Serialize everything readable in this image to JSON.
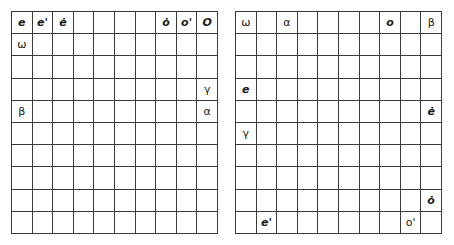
{
  "grids": [
    {
      "name": "left",
      "rows": 10,
      "cols": 10,
      "symbols": [
        {
          "row": 0,
          "col": 0,
          "text": "e",
          "italic": true
        },
        {
          "row": 0,
          "col": 1,
          "text": "e'",
          "italic": true
        },
        {
          "row": 0,
          "col": 2,
          "text": "ė",
          "italic": true
        },
        {
          "row": 0,
          "col": 7,
          "text": "ȯ",
          "italic": true
        },
        {
          "row": 0,
          "col": 8,
          "text": "o'",
          "italic": true
        },
        {
          "row": 0,
          "col": 9,
          "text": "O",
          "italic": true
        },
        {
          "row": 1,
          "col": 0,
          "text": "ω",
          "italic": false
        },
        {
          "row": 3,
          "col": 9,
          "text": "γ",
          "italic": false
        },
        {
          "row": 4,
          "col": 0,
          "text": "β",
          "italic": false
        },
        {
          "row": 4,
          "col": 9,
          "text": "α",
          "italic": false
        }
      ]
    },
    {
      "name": "right",
      "rows": 10,
      "cols": 10,
      "symbols": [
        {
          "row": 0,
          "col": 0,
          "text": "ω",
          "italic": false
        },
        {
          "row": 0,
          "col": 2,
          "text": "α",
          "italic": false
        },
        {
          "row": 0,
          "col": 7,
          "text": "o",
          "italic": true
        },
        {
          "row": 0,
          "col": 9,
          "text": "β",
          "italic": false
        },
        {
          "row": 3,
          "col": 0,
          "text": "e",
          "italic": true
        },
        {
          "row": 4,
          "col": 9,
          "text": "ė",
          "italic": true
        },
        {
          "row": 5,
          "col": 0,
          "text": "γ",
          "italic": false
        },
        {
          "row": 8,
          "col": 9,
          "text": "ȯ",
          "italic": true
        },
        {
          "row": 9,
          "col": 1,
          "text": "e'",
          "italic": true
        },
        {
          "row": 9,
          "col": 8,
          "text": "o'",
          "italic": false
        }
      ]
    }
  ]
}
